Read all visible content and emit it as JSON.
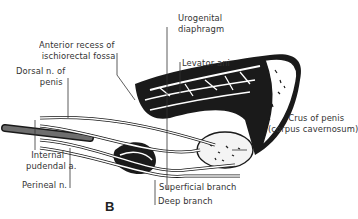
{
  "figure": {
    "panel_label": "B",
    "labels": {
      "urogenital_diaphragm": [
        "Urogenital",
        "diaphragm"
      ],
      "anterior_recess": [
        "Anterior recess of",
        "ischiorectal fossa"
      ],
      "dorsal_nerve": [
        "Dorsal n. of",
        "penis"
      ],
      "levator_ani": "Levator ani",
      "crus_of_penis": [
        "Crus of penis",
        "(corpus cavernosum)"
      ],
      "internal_pudendal": [
        "Internal",
        "pudendal a."
      ],
      "perineal_nerve": "Perineal n.",
      "superficial_branch": "Superficial branch",
      "deep_branch": "Deep branch"
    },
    "colors": {
      "ink": "#1a1a1a",
      "label": "#333333",
      "vessel": "#6e6e6e"
    }
  }
}
